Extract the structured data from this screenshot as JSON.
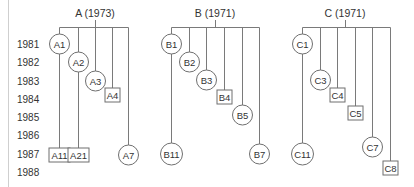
{
  "years": [
    {
      "label": "1981",
      "y": 44
    },
    {
      "label": "1982",
      "y": 62
    },
    {
      "label": "1983",
      "y": 81
    },
    {
      "label": "1984",
      "y": 99
    },
    {
      "label": "1985",
      "y": 117
    },
    {
      "label": "1986",
      "y": 135
    },
    {
      "label": "1987",
      "y": 154
    },
    {
      "label": "1988",
      "y": 172
    }
  ],
  "trees": [
    {
      "title": "A (1973)",
      "title_x": 95,
      "connector_x": 95,
      "bar_y": 27,
      "bar_x1": 59,
      "bar_x2": 128,
      "branches": [
        {
          "x": 59,
          "nodes": [
            {
              "label": "A1",
              "shape": "circle",
              "y": 44
            },
            {
              "label": "A11",
              "shape": "box",
              "y": 155
            }
          ]
        },
        {
          "x": 78,
          "nodes": [
            {
              "label": "A2",
              "shape": "circle",
              "y": 62
            },
            {
              "label": "A21",
              "shape": "box",
              "y": 155
            }
          ]
        },
        {
          "x": 95,
          "nodes": [
            {
              "label": "A3",
              "shape": "circle",
              "y": 81
            }
          ]
        },
        {
          "x": 112,
          "nodes": [
            {
              "label": "A4",
              "shape": "box",
              "y": 95
            }
          ]
        },
        {
          "x": 128,
          "nodes": [
            {
              "label": "A7",
              "shape": "circle",
              "y": 155
            }
          ]
        }
      ]
    },
    {
      "title": "B (1971)",
      "title_x": 215,
      "connector_x": 215,
      "bar_y": 27,
      "bar_x1": 171,
      "bar_x2": 259,
      "branches": [
        {
          "x": 171,
          "nodes": [
            {
              "label": "B1",
              "shape": "circle",
              "y": 44
            },
            {
              "label": "B11",
              "shape": "circle",
              "y": 154
            }
          ]
        },
        {
          "x": 189,
          "nodes": [
            {
              "label": "B2",
              "shape": "circle",
              "y": 62
            }
          ]
        },
        {
          "x": 206,
          "nodes": [
            {
              "label": "B3",
              "shape": "circle",
              "y": 80
            }
          ]
        },
        {
          "x": 224,
          "nodes": [
            {
              "label": "B4",
              "shape": "box",
              "y": 97
            }
          ]
        },
        {
          "x": 242,
          "nodes": [
            {
              "label": "B5",
              "shape": "circle",
              "y": 115
            }
          ]
        },
        {
          "x": 259,
          "nodes": [
            {
              "label": "B7",
              "shape": "circle",
              "y": 154
            }
          ]
        }
      ]
    },
    {
      "title": "C (1971)",
      "title_x": 345,
      "connector_x": 345,
      "bar_y": 27,
      "bar_x1": 302,
      "bar_x2": 390,
      "branches": [
        {
          "x": 302,
          "nodes": [
            {
              "label": "C1",
              "shape": "circle",
              "y": 44
            },
            {
              "label": "C11",
              "shape": "circle",
              "y": 154
            }
          ]
        },
        {
          "x": 320,
          "nodes": [
            {
              "label": "C3",
              "shape": "circle",
              "y": 80
            }
          ]
        },
        {
          "x": 337,
          "nodes": [
            {
              "label": "C4",
              "shape": "box",
              "y": 95
            }
          ]
        },
        {
          "x": 355,
          "nodes": [
            {
              "label": "C5",
              "shape": "box",
              "y": 113
            }
          ]
        },
        {
          "x": 372,
          "nodes": [
            {
              "label": "C7",
              "shape": "circle",
              "y": 147
            }
          ]
        },
        {
          "x": 390,
          "nodes": [
            {
              "label": "C8",
              "shape": "box",
              "y": 168
            }
          ]
        }
      ]
    }
  ],
  "colors": {
    "line": "#7a7a7a",
    "text": "#333333",
    "axis_rule": "#cfcfcf"
  }
}
